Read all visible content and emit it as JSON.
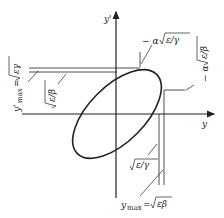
{
  "diagram": {
    "type": "phase-space ellipse",
    "axes": {
      "x_label": "y",
      "y_label": "y'"
    },
    "annotations": {
      "top_tangent": "− α √(ε/γ)",
      "right_tangent": "− α √(ε/β)",
      "ymax_prime": "y'max = √(εγ)",
      "sqrt_eps_beta_left": "√(ε/β)",
      "sqrt_eps_gamma_bottom": "√(ε/γ)",
      "ymax": "ymax = √(εβ)"
    },
    "text": {
      "x_axis": "y",
      "y_axis": "y'",
      "minus_alpha": "− α",
      "sqrt_e_over_g": "ε/γ",
      "sqrt_e_over_b": "ε/β",
      "eps_gamma": "εγ",
      "eps_beta": "εβ",
      "ymax_prefix": "y",
      "max_sub": "max",
      "equals": "=",
      "yprime": "y'"
    },
    "colors": {
      "stroke": "#222222",
      "background": "#ffffff"
    }
  }
}
